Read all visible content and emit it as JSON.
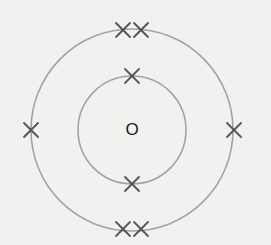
{
  "diagram": {
    "type": "electron-shell-diagram",
    "nucleus": {
      "label": "O"
    },
    "colors": {
      "background": "#f1f1f0",
      "shell_stroke": "#a3a3a3",
      "electron_mark": "#555555",
      "label": "#1a1a1a"
    },
    "center": {
      "x": 132,
      "y": 130
    },
    "shells": [
      {
        "name": "inner-shell",
        "radius": 54,
        "electron_count": 2,
        "electrons": [
          {
            "x": 132,
            "y": 76
          },
          {
            "x": 132,
            "y": 184
          }
        ]
      },
      {
        "name": "outer-shell",
        "radius": 101,
        "electron_count": 6,
        "electrons": [
          {
            "x": 123,
            "y": 30
          },
          {
            "x": 141,
            "y": 30
          },
          {
            "x": 31,
            "y": 130
          },
          {
            "x": 234,
            "y": 130
          },
          {
            "x": 123,
            "y": 229
          },
          {
            "x": 141,
            "y": 229
          }
        ]
      }
    ],
    "electron_symbol": "×"
  }
}
